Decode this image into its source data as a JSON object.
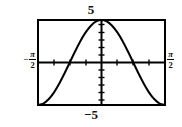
{
  "figure": {
    "background_color": "#ffffff",
    "ink_color": "#000000",
    "frame": {
      "left": 38,
      "top": 20,
      "right": 165,
      "bottom": 105,
      "border_width": 2
    },
    "labels": {
      "y_max": "5",
      "y_min": "−5",
      "x_min_sign": "−",
      "x_min_numerator": "π",
      "x_min_denominator": "2",
      "x_max_numerator": "π",
      "x_max_denominator": "2"
    }
  },
  "chart_data": {
    "type": "line",
    "title": "",
    "xlabel": "",
    "ylabel": "",
    "xlim": [
      -1.5707963,
      1.5707963
    ],
    "ylim": [
      -5,
      5
    ],
    "x_tick_labels": [
      "−π/2",
      "π/2"
    ],
    "y_tick_labels": [
      "−5",
      "5"
    ],
    "grid": false,
    "legend": null,
    "axes_style": "calculator-window",
    "x_axis_y_value": 0,
    "y_axis_x_value": 0,
    "x_tick_count": 8,
    "y_tick_count": 10,
    "series": [
      {
        "name": "y = -5 cos(2x)",
        "stroke_width": 2,
        "x": [
          -1.5707963,
          -1.4398966,
          -1.3089969,
          -1.1780972,
          -1.0471976,
          -0.9162979,
          -0.7853982,
          -0.6544985,
          -0.5235988,
          -0.3926991,
          -0.2617994,
          -0.1308997,
          0.0,
          0.1308997,
          0.2617994,
          0.3926991,
          0.5235988,
          0.6544985,
          0.7853982,
          0.9162979,
          1.0471976,
          1.1780972,
          1.3089969,
          1.4398966,
          1.5707963
        ],
        "y": [
          -5.0,
          -4.83,
          -4.33,
          -3.54,
          -2.5,
          -1.29,
          0.0,
          1.29,
          2.5,
          3.54,
          4.33,
          4.83,
          5.0,
          4.83,
          4.33,
          3.54,
          2.5,
          1.29,
          0.0,
          -1.29,
          -2.5,
          -3.54,
          -4.33,
          -4.83,
          -5.0
        ]
      }
    ]
  }
}
